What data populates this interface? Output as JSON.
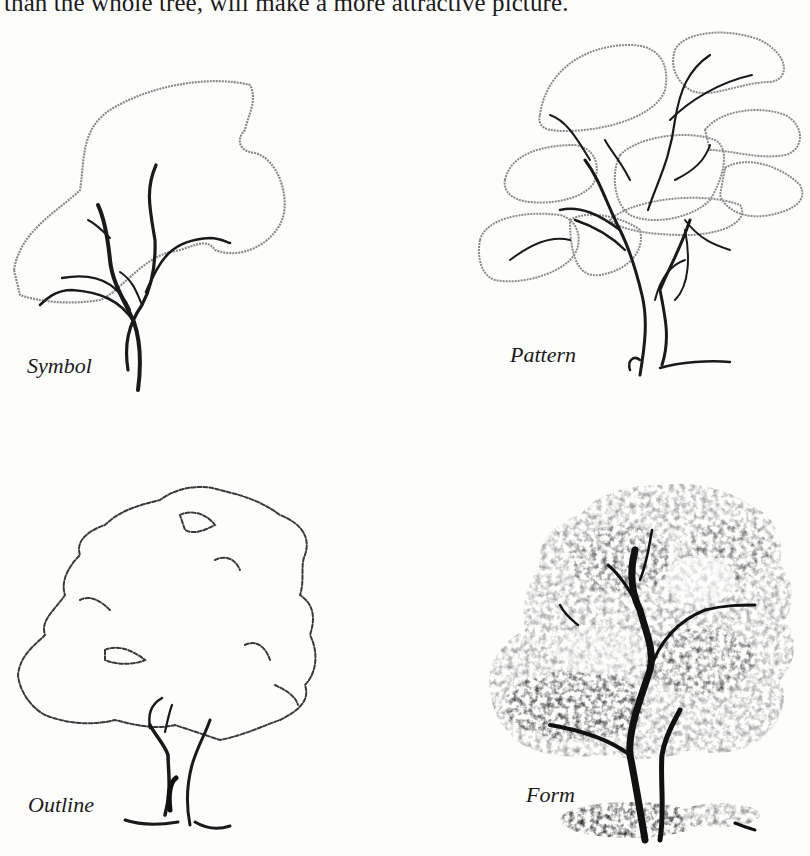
{
  "page": {
    "top_text": "than the whole tree, will make a more attractive picture."
  },
  "figures": [
    {
      "id": "symbol",
      "caption": "Symbol",
      "illustration": "tree-symbol-drawing"
    },
    {
      "id": "pattern",
      "caption": "Pattern",
      "illustration": "tree-pattern-drawing"
    },
    {
      "id": "outline",
      "caption": "Outline",
      "illustration": "tree-outline-drawing"
    },
    {
      "id": "form",
      "caption": "Form",
      "illustration": "tree-form-drawing"
    }
  ],
  "colors": {
    "ink": "#1a1a1a",
    "pencil_light": "#8a8a8a",
    "paper": "#fdfdfc"
  }
}
